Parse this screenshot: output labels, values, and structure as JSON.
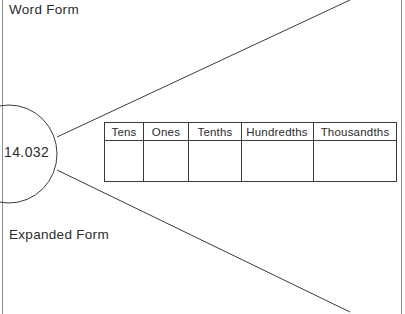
{
  "worksheet": {
    "background_color": "#ffffff",
    "ink_color": "#2b2b2b",
    "line_color": "#3a3a3a",
    "margin_line_color": "#8d8d8d"
  },
  "labels": {
    "word_form": "Word Form",
    "expanded_form": "Expanded Form"
  },
  "number_oval": {
    "value": "14.032"
  },
  "place_value_table": {
    "headers": [
      "Tens",
      "Ones",
      "Tenths",
      "Hundredths",
      "Thousandths"
    ],
    "values": [
      "",
      "",
      "",
      "",
      ""
    ]
  }
}
